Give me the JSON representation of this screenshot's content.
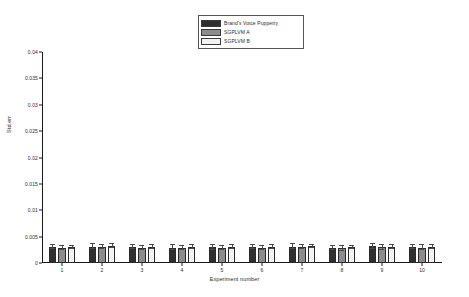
{
  "chart_data": {
    "type": "bar",
    "title": "",
    "xlabel": "Experiment number",
    "ylabel": "Std.err",
    "categories": [
      "1",
      "2",
      "3",
      "4",
      "5",
      "6",
      "7",
      "8",
      "9",
      "10"
    ],
    "ylim": [
      0,
      0.04
    ],
    "yticks": [
      "0",
      "0.005",
      "0.01",
      "0.015",
      "0.02",
      "0.025",
      "0.03",
      "0.035",
      "0.04"
    ],
    "ytick_values": [
      0,
      0.005,
      0.01,
      0.015,
      0.02,
      0.025,
      0.03,
      0.035,
      0.04
    ],
    "grid": false,
    "legend_position": "top-center",
    "series": [
      {
        "name": "Brand's Voice Puppetry",
        "color": "#2f2f2f",
        "values": [
          0.00298,
          0.0031,
          0.00306,
          0.00291,
          0.00295,
          0.00304,
          0.00308,
          0.00292,
          0.00314,
          0.00303
        ],
        "errors": [
          0.0004,
          0.00045,
          0.00044,
          0.00042,
          0.00043,
          0.00043,
          0.00045,
          0.00039,
          0.00043,
          0.00043
        ]
      },
      {
        "name": "SGPLVM A",
        "color": "#8c8c8c",
        "values": [
          0.00282,
          0.00296,
          0.00289,
          0.00277,
          0.00282,
          0.00289,
          0.00296,
          0.00276,
          0.00295,
          0.00292
        ],
        "errors": [
          0.00033,
          0.00037,
          0.00039,
          0.00038,
          0.00038,
          0.00037,
          0.00037,
          0.00039,
          0.00042,
          0.00045
        ]
      },
      {
        "name": "SGPLVM B",
        "color": "#f2f2f2",
        "values": [
          0.003,
          0.00316,
          0.00308,
          0.00298,
          0.003,
          0.00307,
          0.00315,
          0.00297,
          0.00312,
          0.00308
        ],
        "errors": [
          0.00032,
          0.00036,
          0.00035,
          0.00035,
          0.00035,
          0.00034,
          0.00035,
          0.00035,
          0.00038,
          0.00037
        ]
      }
    ]
  },
  "legend": {
    "entries": [
      {
        "label": "Brand's Voice Puppetry"
      },
      {
        "label": "SGPLVM A"
      },
      {
        "label": "SGPLVM B"
      }
    ]
  }
}
